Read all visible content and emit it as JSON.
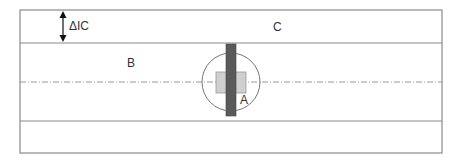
{
  "diagram": {
    "labels": {
      "delta": "ΔIC",
      "region_b": "B",
      "region_c": "C",
      "component_a": "A"
    },
    "colors": {
      "outline": "#8a8a8a",
      "bar": "#5a5a5a",
      "square": "#cfcfcf",
      "centerline": "#999999",
      "text": "#333333"
    }
  }
}
